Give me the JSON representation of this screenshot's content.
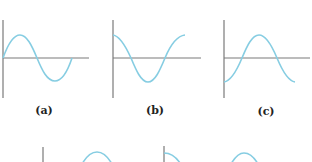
{
  "figure": {
    "panels": [
      {
        "id": "a",
        "label": "(a)",
        "waveform": "sine",
        "description": "starts at zero, rises to positive peak"
      },
      {
        "id": "b",
        "label": "(b)",
        "waveform": "cosine",
        "description": "starts at positive maximum"
      },
      {
        "id": "c",
        "label": "(c)",
        "waveform": "negative-cosine",
        "description": "starts at negative minimum"
      }
    ],
    "partial_row": [
      {
        "id": "d",
        "waveform": "partial",
        "description": "cropped panel, axis and arc visible"
      },
      {
        "id": "e",
        "waveform": "partial",
        "description": "cropped panel, axis and arcs visible"
      }
    ],
    "colors": {
      "wave": "#86cde2",
      "axis": "#7a7a7a",
      "label": "#222222"
    }
  }
}
